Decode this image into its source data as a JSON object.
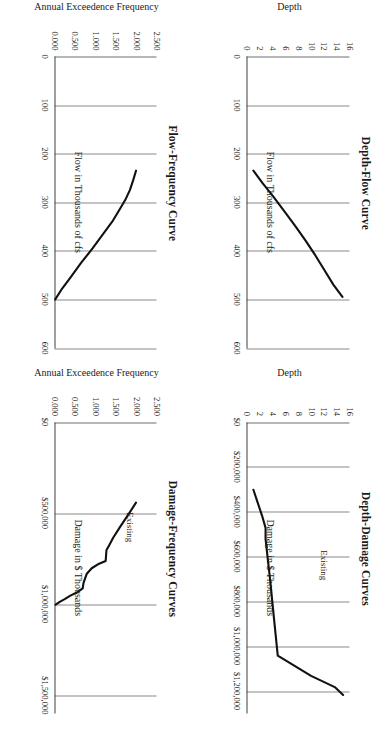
{
  "figure": {
    "orientation": "rotated-90-clockwise",
    "background": "#ffffff",
    "curve_color": "#111111",
    "gridline_color": "#8a8a8a"
  },
  "chart_data": [
    {
      "id": "depth-flow-curve",
      "type": "line",
      "title": "Depth-Flow Curve",
      "xlabel": "Flow in Thousands of cfs",
      "ylabel": "Depth",
      "xlim": [
        0,
        600
      ],
      "ylim": [
        0,
        16
      ],
      "xticks": [
        "0",
        "100",
        "200",
        "300",
        "400",
        "500",
        "600"
      ],
      "xtick_values": [
        0,
        100,
        200,
        300,
        400,
        500,
        600
      ],
      "yticks": [
        "0",
        "2",
        "4",
        "6",
        "8",
        "10",
        "12",
        "14",
        "16"
      ],
      "ytick_values": [
        0,
        2,
        4,
        6,
        8,
        10,
        12,
        14,
        16
      ],
      "grid": "vertical",
      "legend": null,
      "series": [
        {
          "name": "Depth-Flow",
          "x": [
            235,
            260,
            290,
            320,
            350,
            380,
            410,
            440,
            470,
            495
          ],
          "y": [
            1.0,
            2.4,
            4.2,
            5.9,
            7.6,
            9.2,
            10.7,
            12.1,
            13.5,
            14.9
          ]
        }
      ]
    },
    {
      "id": "depth-damage-curves",
      "type": "line",
      "title": "Depth-Damage Curves",
      "xlabel": "Damage in $ Thousands",
      "ylabel": "Depth",
      "xlim": [
        0,
        1300000
      ],
      "ylim": [
        0,
        16
      ],
      "xticks": [
        "$0",
        "$200,000",
        "$400,000",
        "$600,000",
        "$800,000",
        "$1,000,000",
        "$1,200,000"
      ],
      "xtick_values": [
        0,
        200000,
        400000,
        600000,
        800000,
        1000000,
        1200000
      ],
      "yticks": [
        "0",
        "2",
        "4",
        "6",
        "8",
        "10",
        "12",
        "14",
        "16"
      ],
      "ytick_values": [
        0,
        2,
        4,
        6,
        8,
        10,
        12,
        14,
        16
      ],
      "grid": "vertical",
      "legend": "Existing",
      "series": [
        {
          "name": "Existing",
          "x": [
            300000,
            420000,
            470000,
            520000,
            700000,
            870000,
            1040000,
            1130000,
            1180000,
            1215000
          ],
          "y": [
            1.0,
            2.4,
            2.9,
            2.9,
            3.6,
            4.2,
            4.8,
            10.0,
            13.7,
            15.0
          ]
        }
      ]
    },
    {
      "id": "flow-frequency-curve",
      "type": "line",
      "title": "Flow-Frequency Curve",
      "xlabel": "Flow in Thousands of cfs",
      "ylabel": "Annual Exceedence Frequency",
      "xlim": [
        0,
        600
      ],
      "ylim": [
        0.0,
        2.5
      ],
      "xticks": [
        "0",
        "100",
        "200",
        "300",
        "400",
        "500",
        "600"
      ],
      "xtick_values": [
        0,
        100,
        200,
        300,
        400,
        500,
        600
      ],
      "yticks": [
        "0.000",
        "0.500",
        "1.000",
        "1.500",
        "2.000",
        "2.500"
      ],
      "ytick_values": [
        0.0,
        0.5,
        1.0,
        1.5,
        2.0,
        2.5
      ],
      "grid": "vertical",
      "legend": null,
      "series": [
        {
          "name": "Flow-Frequency",
          "x": [
            235,
            255,
            275,
            295,
            315,
            340,
            365,
            395,
            425,
            455,
            480,
            500
          ],
          "y": [
            2.0,
            1.93,
            1.85,
            1.74,
            1.6,
            1.42,
            1.2,
            0.94,
            0.66,
            0.4,
            0.18,
            0.03
          ]
        }
      ]
    },
    {
      "id": "damage-frequency-curves",
      "type": "line",
      "title": "Damage-Frequency Curves",
      "xlabel": "Damage in $ Thousands",
      "ylabel": "Annual Exceedence Frequency",
      "xlim": [
        0,
        1600000
      ],
      "ylim": [
        0.0,
        2.5
      ],
      "xticks": [
        "$0",
        "$500,000",
        "$1,000,000",
        "$1,500,000"
      ],
      "xtick_values": [
        0,
        500000,
        1000000,
        1500000
      ],
      "yticks": [
        "0.000",
        "0.500",
        "1.000",
        "1.500",
        "2.000",
        "2.500"
      ],
      "ytick_values": [
        0.0,
        0.5,
        1.0,
        1.5,
        2.0,
        2.5
      ],
      "grid": "vertical",
      "legend": "Existing",
      "series": [
        {
          "name": "Existing",
          "x": [
            440000,
            510000,
            570000,
            630000,
            680000,
            700000,
            760000,
            775000,
            800000,
            830000,
            880000,
            910000,
            930000,
            950000,
            970000,
            985000,
            1000000
          ],
          "y": [
            2.0,
            1.8,
            1.62,
            1.45,
            1.33,
            1.28,
            1.26,
            1.1,
            0.92,
            0.8,
            0.72,
            0.7,
            0.58,
            0.4,
            0.26,
            0.14,
            0.04
          ]
        }
      ]
    }
  ]
}
